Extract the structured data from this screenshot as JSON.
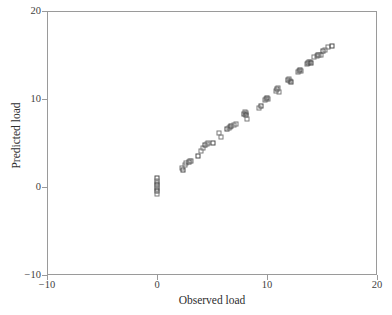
{
  "chart_data": {
    "type": "scatter",
    "title": "",
    "xlabel": "Observed load",
    "ylabel": "Predicted load",
    "xlim": [
      -10,
      20
    ],
    "ylim": [
      -10,
      20
    ],
    "xticks": [
      -10,
      0,
      10,
      20
    ],
    "yticks": [
      -10,
      0,
      10,
      20
    ],
    "xtick_labels": [
      "−10",
      "0",
      "10",
      "20"
    ],
    "ytick_labels": [
      "−10",
      "0",
      "10",
      "20"
    ],
    "grid": false,
    "legend": "none",
    "marker": "open-square",
    "marker_color": "#7b7b7b",
    "n_points": 84,
    "series": [
      {
        "name": "Observed vs predicted load",
        "points": [
          [
            0.0,
            1.0
          ],
          [
            0.0,
            0.7
          ],
          [
            0.0,
            0.45
          ],
          [
            0.0,
            0.2
          ],
          [
            0.0,
            0.0
          ],
          [
            0.0,
            -0.25
          ],
          [
            0.0,
            -0.5
          ],
          [
            0.0,
            -0.8
          ],
          [
            2.3,
            2.2
          ],
          [
            2.35,
            1.95
          ],
          [
            2.5,
            2.5
          ],
          [
            2.6,
            2.7
          ],
          [
            2.9,
            2.85
          ],
          [
            3.0,
            2.95
          ],
          [
            3.1,
            3.0
          ],
          [
            3.7,
            3.5
          ],
          [
            4.0,
            4.1
          ],
          [
            4.2,
            4.4
          ],
          [
            4.35,
            4.8
          ],
          [
            4.5,
            4.9
          ],
          [
            4.6,
            5.05
          ],
          [
            5.1,
            5.0
          ],
          [
            5.6,
            6.1
          ],
          [
            5.8,
            5.7
          ],
          [
            6.4,
            6.6
          ],
          [
            6.5,
            6.75
          ],
          [
            6.6,
            6.8
          ],
          [
            6.7,
            6.9
          ],
          [
            7.0,
            7.1
          ],
          [
            7.15,
            7.2
          ],
          [
            7.9,
            8.35
          ],
          [
            8.0,
            8.5
          ],
          [
            8.05,
            8.45
          ],
          [
            8.1,
            8.2
          ],
          [
            8.2,
            7.7
          ],
          [
            9.3,
            9.0
          ],
          [
            9.45,
            9.15
          ],
          [
            9.8,
            9.9
          ],
          [
            9.9,
            10.0
          ],
          [
            10.0,
            10.1
          ],
          [
            10.05,
            9.95
          ],
          [
            10.8,
            10.9
          ],
          [
            10.9,
            11.1
          ],
          [
            11.0,
            11.2
          ],
          [
            11.05,
            10.8
          ],
          [
            11.9,
            12.2
          ],
          [
            12.0,
            12.3
          ],
          [
            12.1,
            12.0
          ],
          [
            12.15,
            11.9
          ],
          [
            12.8,
            13.1
          ],
          [
            12.9,
            13.2
          ],
          [
            13.0,
            13.3
          ],
          [
            13.05,
            13.15
          ],
          [
            13.6,
            14.0
          ],
          [
            13.7,
            14.1
          ],
          [
            13.8,
            14.15
          ],
          [
            13.9,
            14.2
          ],
          [
            14.0,
            14.1
          ],
          [
            14.3,
            14.8
          ],
          [
            14.5,
            14.9
          ],
          [
            14.6,
            15.0
          ],
          [
            14.7,
            15.05
          ],
          [
            14.9,
            14.95
          ],
          [
            15.1,
            15.5
          ],
          [
            15.3,
            15.6
          ],
          [
            15.5,
            15.9
          ],
          [
            15.9,
            16.0
          ]
        ]
      }
    ]
  },
  "axes": {
    "x_title": "Observed load",
    "y_title": "Predicted load",
    "x_ticks": [
      {
        "value": -10,
        "label": "−10"
      },
      {
        "value": 0,
        "label": "0"
      },
      {
        "value": 10,
        "label": "10"
      },
      {
        "value": 20,
        "label": "20"
      }
    ],
    "y_ticks": [
      {
        "value": 20,
        "label": "20"
      },
      {
        "value": 10,
        "label": "10"
      },
      {
        "value": 0,
        "label": "0"
      },
      {
        "value": -10,
        "label": "−10"
      }
    ]
  }
}
